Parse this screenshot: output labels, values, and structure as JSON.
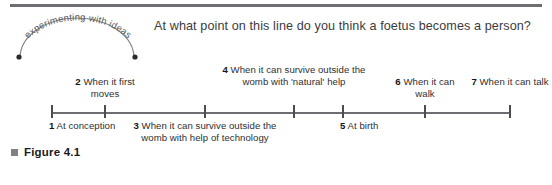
{
  "figure": {
    "caption": "Figure 4.1",
    "bullet_icon": "square-bullet-icon",
    "bullet_color": "#808184"
  },
  "badge": {
    "text": "experimenting with ideas",
    "shape": "arc",
    "endpoint_icon": "dot-icon",
    "color": "#58595b"
  },
  "question": "At what point on this line do you think a foetus becomes a person?",
  "timeline": {
    "axis_color": "#6d6e71",
    "tick_color": "#4d4d4f",
    "points": [
      {
        "number": "1",
        "text": "At conception",
        "position": "below",
        "align": "left",
        "x": 52
      },
      {
        "number": "2",
        "text": "When it first moves",
        "position": "above",
        "align": "center",
        "x": 105
      },
      {
        "number": "3",
        "text": "When it can survive outside the womb with help of technology",
        "position": "below",
        "align": "center",
        "x": 205
      },
      {
        "number": "4",
        "text": "When it can survive outside the womb with 'natural' help",
        "position": "above",
        "align": "center",
        "x": 294
      },
      {
        "number": "5",
        "text": "At birth",
        "position": "below",
        "align": "left",
        "x": 343
      },
      {
        "number": "6",
        "text": "When it can walk",
        "position": "above",
        "align": "center",
        "x": 425
      },
      {
        "number": "7",
        "text": "When it can talk",
        "position": "above",
        "align": "center",
        "x": 510
      }
    ]
  }
}
